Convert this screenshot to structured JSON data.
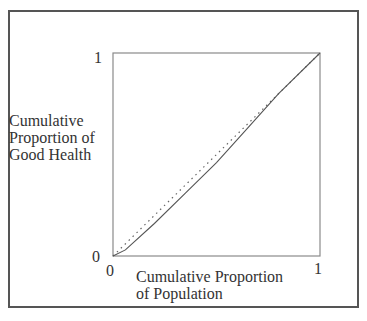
{
  "chart_data": {
    "type": "line",
    "title": "",
    "xlabel": "Cumulative Proportion of Population",
    "ylabel": "Cumulative Proportion of Good Health",
    "xlim": [
      0,
      1
    ],
    "ylim": [
      0,
      1
    ],
    "grid": false,
    "legend": null,
    "x_ticks": [
      "0",
      "1"
    ],
    "y_ticks": [
      "0",
      "1"
    ],
    "series": [
      {
        "name": "Concentration curve",
        "style": "solid",
        "x": [
          0,
          0.06,
          0.2,
          0.35,
          0.5,
          0.65,
          0.8,
          1.0
        ],
        "y": [
          0,
          0.03,
          0.16,
          0.31,
          0.46,
          0.63,
          0.8,
          1.0
        ]
      },
      {
        "name": "Line of equality",
        "style": "dotted",
        "x": [
          0,
          1
        ],
        "y": [
          0,
          1
        ]
      }
    ]
  },
  "labels": {
    "ylabel_lines": [
      "Cumulative",
      "Proportion of",
      "Good Health"
    ],
    "xlabel_lines": [
      "Cumulative Proportion",
      "of Population"
    ],
    "y_tick_top": "1",
    "y_tick_bottom": "0",
    "x_tick_left": "0",
    "x_tick_right": "1"
  },
  "colors": {
    "frame": "#555555",
    "axes": "#888888",
    "curve": "#555555",
    "equality": "#666666"
  }
}
